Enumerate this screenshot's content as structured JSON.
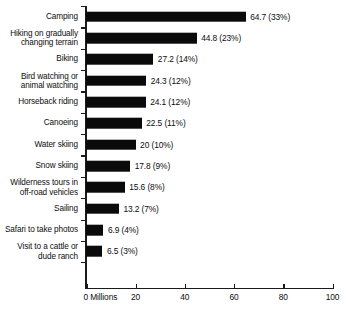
{
  "chart_data": {
    "type": "bar",
    "orientation": "horizontal",
    "title": "",
    "subtitle": "",
    "xlabel": "Millions",
    "ylabel": "",
    "xlim": [
      0,
      100
    ],
    "grid": false,
    "legend": null,
    "bar_color": "#0a0a0a",
    "background_color": "#ffffff",
    "xticks": [
      {
        "value": 0,
        "label": "0 Millions"
      },
      {
        "value": 20,
        "label": "20"
      },
      {
        "value": 40,
        "label": "40"
      },
      {
        "value": 60,
        "label": "60"
      },
      {
        "value": 80,
        "label": "80"
      },
      {
        "value": 100,
        "label": "100"
      }
    ],
    "categories": [
      "Camping",
      "Hiking on gradually\nchanging terrain",
      "Biking",
      "Bird watching or\nanimal watching",
      "Horseback riding",
      "Canoeing",
      "Water skiing",
      "Snow skiing",
      "Wilderness tours in\noff-road vehicles",
      "Sailing",
      "Safari to take photos",
      "Visit to a cattle or\ndude ranch"
    ],
    "values": [
      64.7,
      44.8,
      27.2,
      24.3,
      24.1,
      22.5,
      20,
      17.8,
      15.6,
      13.2,
      6.9,
      6.5
    ],
    "percents": [
      33,
      23,
      14,
      12,
      12,
      11,
      10,
      9,
      8,
      7,
      4,
      3
    ],
    "data_labels": [
      "64.7 (33%)",
      "44.8 (23%)",
      "27.2 (14%)",
      "24.3 (12%)",
      "24.1 (12%)",
      "22.5 (11%)",
      "20 (10%)",
      "17.8 (9%)",
      "15.6 (8%)",
      "13.2 (7%)",
      "6.9 (4%)",
      "6.5 (3%)"
    ]
  }
}
